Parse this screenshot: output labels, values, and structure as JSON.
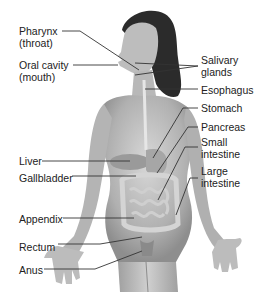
{
  "diagram": {
    "labels_left": [
      {
        "id": "pharynx",
        "line1": "Pharynx",
        "line2": "(throat)"
      },
      {
        "id": "oral-cavity",
        "line1": "Oral cavity",
        "line2": "(mouth)"
      },
      {
        "id": "liver",
        "line1": "Liver"
      },
      {
        "id": "gallbladder",
        "line1": "Gallbladder"
      },
      {
        "id": "appendix",
        "line1": "Appendix"
      },
      {
        "id": "rectum",
        "line1": "Rectum"
      },
      {
        "id": "anus",
        "line1": "Anus"
      }
    ],
    "labels_right": [
      {
        "id": "salivary-glands",
        "line1": "Salivary",
        "line2": "glands"
      },
      {
        "id": "esophagus",
        "line1": "Esophagus"
      },
      {
        "id": "stomach",
        "line1": "Stomach"
      },
      {
        "id": "pancreas",
        "line1": "Pancreas"
      },
      {
        "id": "small-intestine",
        "line1": "Small",
        "line2": "intestine"
      },
      {
        "id": "large-intestine",
        "line1": "Large",
        "line2": "intestine"
      }
    ],
    "colors": {
      "skin_light": "#d9d9d9",
      "skin_mid": "#b5b5b5",
      "skin_dark": "#8a8a8a",
      "hair": "#2a2a2a",
      "line": "#333333",
      "text": "#222222",
      "organ": "#c8c8c8"
    }
  }
}
